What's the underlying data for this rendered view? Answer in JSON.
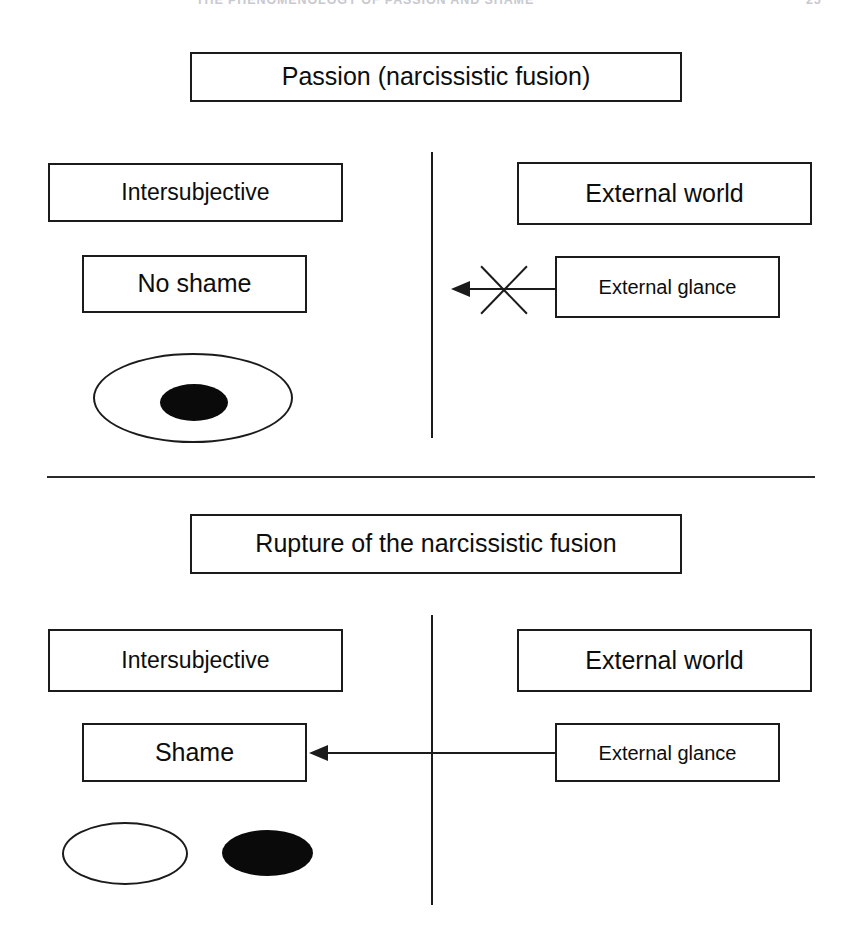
{
  "page": {
    "running_head_title": "THE PHENOMENOLOGY OF PASSION AND SHAME",
    "page_number": "25"
  },
  "panels": [
    {
      "id": "passion",
      "title": "Passion (narcissistic fusion)",
      "left_column_label": "Intersubjective",
      "right_column_label": "External world",
      "affect_box": "No shame",
      "stimulus_box": "External glance",
      "arrow_blocked": true,
      "blocked_marker": "x-cross",
      "self_other_figure": "concentric-ellipses-fused"
    },
    {
      "id": "rupture",
      "title": "Rupture of the narcissistic fusion",
      "left_column_label": "Intersubjective",
      "right_column_label": "External world",
      "affect_box": "Shame",
      "stimulus_box": "External glance",
      "arrow_blocked": false,
      "blocked_marker": "",
      "self_other_figure": "separate-ellipses-split"
    }
  ],
  "colors": {
    "stroke": "#1b1b1b",
    "fill_black": "#0a0a0a",
    "background": "#ffffff",
    "running_head": "#c9c9cf"
  }
}
